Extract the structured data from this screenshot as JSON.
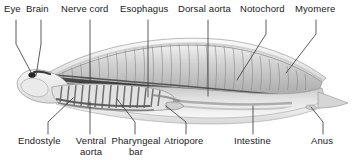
{
  "figure": {
    "title_text": "",
    "background_color": "#ffffff",
    "text_color": "#1a1a1a",
    "leader_line_color": "#333333",
    "body_outline_color": "#8a8a8a",
    "body_fill_light": "#f2f2f2",
    "body_fill_mid": "#c9c9c9",
    "body_fill_dark": "#9a9a9a",
    "notochord_color": "#3a3a3a"
  },
  "labels_top": [
    {
      "id": "eye",
      "text": "Eye"
    },
    {
      "id": "brain",
      "text": "Brain"
    },
    {
      "id": "nerve-cord",
      "text": "Nerve cord"
    },
    {
      "id": "esophagus",
      "text": "Esophagus"
    },
    {
      "id": "dorsal-aorta",
      "text": "Dorsal aorta"
    },
    {
      "id": "notochord",
      "text": "Notochord"
    },
    {
      "id": "myomere",
      "text": "Myomere"
    }
  ],
  "labels_bottom": [
    {
      "id": "endostyle",
      "text": "Endostyle"
    },
    {
      "id": "ventral-aorta",
      "text": "Ventral",
      "text2": "aorta"
    },
    {
      "id": "pharyngeal-bar",
      "text": "Pharyngeal",
      "text2": "bar"
    },
    {
      "id": "atriopore",
      "text": "Atriopore"
    },
    {
      "id": "intestine",
      "text": "Intestine"
    },
    {
      "id": "anus",
      "text": "Anus"
    }
  ]
}
